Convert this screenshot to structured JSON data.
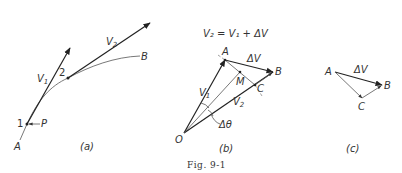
{
  "figure": {
    "caption": "Fig. 9-1",
    "panels": [
      {
        "id": "a",
        "label": "(a)",
        "points": {
          "A": "A",
          "B": "B",
          "1": "1",
          "2": "2",
          "P": "P"
        },
        "vectors": {
          "V1": "V",
          "V1_sub": "1",
          "V2": "V",
          "V2_sub": "2"
        }
      },
      {
        "id": "b",
        "label": "(b)",
        "equation": "V₂ = V₁ + ΔV",
        "points": {
          "O": "O",
          "A": "A",
          "B": "B",
          "C": "C",
          "M": "M"
        },
        "vectors": {
          "V1": "V",
          "V1_sub": "1",
          "V2": "V",
          "V2_sub": "2",
          "dV": "ΔV"
        },
        "angle": "Δθ"
      },
      {
        "id": "c",
        "label": "(c)",
        "points": {
          "A": "A",
          "B": "B",
          "C": "C"
        },
        "vectors": {
          "dV": "ΔV"
        }
      }
    ]
  }
}
